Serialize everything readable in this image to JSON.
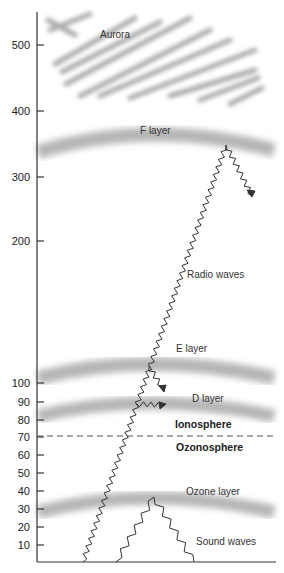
{
  "diagram": {
    "title": "",
    "y_axis": {
      "ticks": [
        {
          "label": "500",
          "y": 45
        },
        {
          "label": "400",
          "y": 111
        },
        {
          "label": "300",
          "y": 177
        },
        {
          "label": "200",
          "y": 241
        },
        {
          "label": "100",
          "y": 383
        },
        {
          "label": "90",
          "y": 402
        },
        {
          "label": "80",
          "y": 420
        },
        {
          "label": "70",
          "y": 437
        },
        {
          "label": "60",
          "y": 455
        },
        {
          "label": "50",
          "y": 473
        },
        {
          "label": "40",
          "y": 491
        },
        {
          "label": "30",
          "y": 509
        },
        {
          "label": "20",
          "y": 527
        },
        {
          "label": "10",
          "y": 545
        }
      ]
    },
    "labels": {
      "aurora": "Aurora",
      "f_layer": "F layer",
      "radio_waves": "Radio waves",
      "e_layer": "E layer",
      "d_layer": "D layer",
      "ionosphere": "Ionosphere",
      "ozonosphere": "Ozonosphere",
      "ozone_layer": "Ozone layer",
      "sound_waves": "Sound waves"
    },
    "colors": {
      "band": "#b8b8b8",
      "aurora": "#9a9a9a",
      "line": "#333333"
    }
  }
}
